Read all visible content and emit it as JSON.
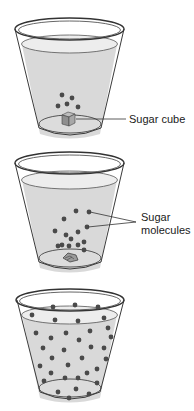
{
  "colors": {
    "water": "#d9d9d9",
    "water_surface": "#ededed",
    "outline": "#3a3a3a",
    "molecule": "#4a4a4a",
    "cube": "#9a9a9a",
    "text": "#1a1a1a"
  },
  "stages": [
    {
      "name": "sugar-cube-stage",
      "label": "Sugar cube",
      "molecule_count": 5
    },
    {
      "name": "dissolving-stage",
      "label_line1": "Sugar",
      "label_line2": "molecules",
      "molecule_count": 14
    },
    {
      "name": "dissolved-stage",
      "molecule_count": 38
    }
  ]
}
